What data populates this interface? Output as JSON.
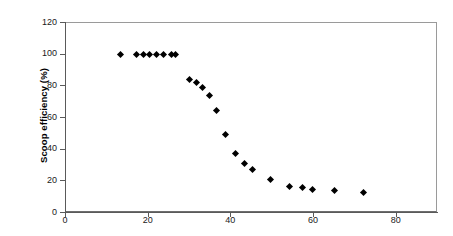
{
  "chart_data": {
    "type": "scatter",
    "title": "",
    "xlabel": "",
    "ylabel": "Scoop efficiency (%)",
    "xlim": [
      0,
      90
    ],
    "ylim": [
      0,
      120
    ],
    "xticks": [
      0,
      20,
      40,
      60,
      80
    ],
    "xtick_labels": [
      "0",
      "20",
      "40",
      "60",
      "80"
    ],
    "yticks": [
      0,
      20,
      40,
      60,
      80,
      100,
      120
    ],
    "ytick_labels": [
      "0",
      "20",
      "40",
      "60",
      "80",
      "100",
      "120"
    ],
    "grid": false,
    "legend": false,
    "marker": "diamond",
    "marker_color": "#000000",
    "points": [
      {
        "x": 13.2,
        "y": 100
      },
      {
        "x": 17.0,
        "y": 100
      },
      {
        "x": 18.7,
        "y": 100
      },
      {
        "x": 20.3,
        "y": 100
      },
      {
        "x": 22.0,
        "y": 100
      },
      {
        "x": 23.6,
        "y": 100
      },
      {
        "x": 25.5,
        "y": 100
      },
      {
        "x": 26.6,
        "y": 100
      },
      {
        "x": 29.8,
        "y": 84.5
      },
      {
        "x": 31.6,
        "y": 82.5
      },
      {
        "x": 33.0,
        "y": 79.5
      },
      {
        "x": 34.6,
        "y": 74.5
      },
      {
        "x": 36.5,
        "y": 64.5
      },
      {
        "x": 38.5,
        "y": 49.5
      },
      {
        "x": 41.0,
        "y": 37.5
      },
      {
        "x": 43.2,
        "y": 31.5
      },
      {
        "x": 45.0,
        "y": 27.5
      },
      {
        "x": 49.5,
        "y": 21.0
      },
      {
        "x": 54.0,
        "y": 17.0
      },
      {
        "x": 57.3,
        "y": 16.0
      },
      {
        "x": 59.6,
        "y": 15.0
      },
      {
        "x": 65.0,
        "y": 14.0
      },
      {
        "x": 72.0,
        "y": 13.0
      }
    ]
  },
  "axes": {
    "y_title": "Scoop efficiency (%)"
  }
}
